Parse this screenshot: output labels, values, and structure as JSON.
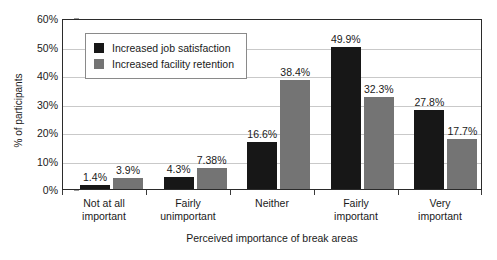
{
  "chart_data": {
    "type": "bar",
    "title": "",
    "subtitle": "",
    "xlabel": "Perceived importance of break areas",
    "ylabel": "% of participants",
    "ylim": [
      0,
      60
    ],
    "ytick_step": 10,
    "ytick_labels": [
      "60%",
      "50%",
      "40%",
      "30%",
      "20%",
      "10%",
      "0%"
    ],
    "ytick_values": [
      60,
      50,
      40,
      30,
      20,
      10,
      0
    ],
    "grid": true,
    "grid_axis": "y",
    "legend_position": "top-left-inside",
    "categories": [
      "Not at all important",
      "Fairly unimportant",
      "Neither",
      "Fairly important",
      "Very important"
    ],
    "category_lines": [
      [
        "Not at all",
        "important"
      ],
      [
        "Fairly",
        "unimportant"
      ],
      [
        "Neither",
        ""
      ],
      [
        "Fairly",
        "important"
      ],
      [
        "Very",
        "important"
      ]
    ],
    "series": [
      {
        "name": "Increased job satisfaction",
        "color": "#171717",
        "values": [
          1.4,
          4.3,
          16.6,
          49.9,
          27.8
        ],
        "labels": [
          "1.4%",
          "4.3%",
          "16.6%",
          "49.9%",
          "27.8%"
        ]
      },
      {
        "name": "Increased facility retention",
        "color": "#747474",
        "values": [
          3.9,
          7.38,
          38.4,
          32.3,
          17.7
        ],
        "labels": [
          "3.9%",
          "7.38%",
          "38.4%",
          "32.3%",
          "17.7%"
        ]
      }
    ]
  },
  "colors": {
    "series_dark": "#171717",
    "series_gray": "#747474",
    "axis": "#2b2b2b",
    "gridline": "#c9c9c9",
    "legend_border": "#8a8a8a",
    "background": "#ffffff",
    "text": "#1a1a1a"
  }
}
